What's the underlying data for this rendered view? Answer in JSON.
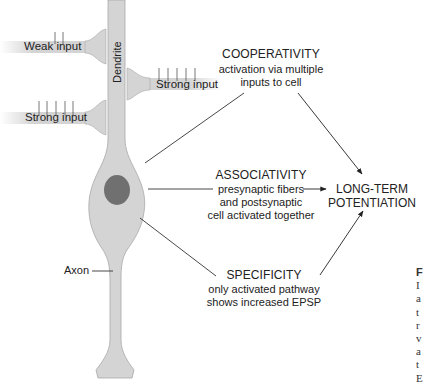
{
  "diagram": {
    "neuron": {
      "dendrite_label": "Dendrite",
      "axon_label": "Axon",
      "fill_color": "#d4d4d4",
      "nucleus_color": "#707070"
    },
    "inputs": [
      {
        "label": "Weak input",
        "side": "left",
        "spikes": 2
      },
      {
        "label": "Strong input",
        "side": "right",
        "spikes": 5
      },
      {
        "label": "Strong input",
        "side": "left",
        "spikes": 5
      }
    ],
    "properties": [
      {
        "heading": "COOPERATIVITY",
        "lines": [
          "activation via multiple",
          "inputs to cell"
        ]
      },
      {
        "heading": "ASSOCIATIVITY",
        "lines": [
          "presynaptic fibers",
          "and postsynaptic",
          "cell activated together"
        ]
      },
      {
        "heading": "SPECIFICITY",
        "lines": [
          "only activated pathway",
          "shows increased EPSP"
        ]
      }
    ],
    "outcome": {
      "lines": [
        "LONG-TERM",
        "POTENTIATION"
      ]
    },
    "caption_fragment": {
      "lines": [
        "F",
        "I",
        "a",
        "t",
        "r",
        "v",
        "a",
        "t",
        "E"
      ]
    }
  }
}
